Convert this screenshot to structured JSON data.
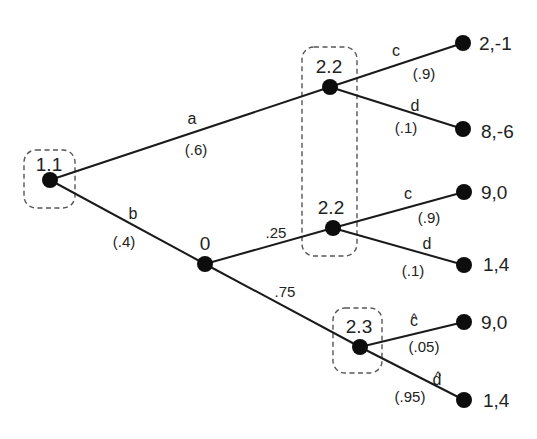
{
  "diagram": {
    "type": "game-tree",
    "nodes": {
      "root": {
        "label": "1.1"
      },
      "chance": {
        "label": "0"
      },
      "p2_top": {
        "label": "2.2"
      },
      "p2_mid": {
        "label": "2.2"
      },
      "p2_bottom": {
        "label": "2.3"
      }
    },
    "edges": {
      "a": {
        "action": "a",
        "prob": "(.6)"
      },
      "b": {
        "action": "b",
        "prob": "(.4)"
      },
      "chance_up": {
        "prob": ".25"
      },
      "chance_down": {
        "prob": ".75"
      },
      "top_c": {
        "action": "c",
        "prob": "(.9)"
      },
      "top_d": {
        "action": "d",
        "prob": "(.1)"
      },
      "mid_c": {
        "action": "c",
        "prob": "(.9)"
      },
      "mid_d": {
        "action": "d",
        "prob": "(.1)"
      },
      "bot_c": {
        "action": "c",
        "hat": "^",
        "prob": "(.05)"
      },
      "bot_d": {
        "action": "d",
        "hat": "^",
        "prob": "(.95)"
      }
    },
    "payoffs": [
      "2,-1",
      "8,-6",
      "9,0",
      "1,4",
      "9,0",
      "1,4"
    ],
    "information_sets": [
      {
        "player": "1",
        "members": [
          "1.1"
        ]
      },
      {
        "player": "2",
        "members": [
          "2.2 (top)",
          "2.2 (middle)"
        ]
      },
      {
        "player": "2",
        "members": [
          "2.3"
        ]
      }
    ]
  }
}
